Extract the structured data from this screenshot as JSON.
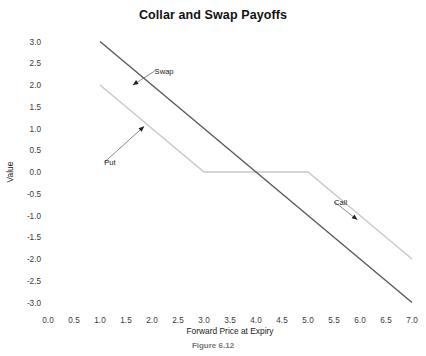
{
  "figure": {
    "title": "Collar and Swap Payoffs",
    "caption": "Figure 6.12"
  },
  "chart_data": {
    "type": "line",
    "title": "Collar and Swap Payoffs",
    "xlabel": "Forward Price at Expiry",
    "ylabel": "Value",
    "xlim": [
      0.0,
      7.0
    ],
    "ylim": [
      -3.0,
      3.0
    ],
    "xticks": [
      "0.0",
      "0.5",
      "1.0",
      "1.5",
      "2.0",
      "2.5",
      "3.0",
      "3.5",
      "4.0",
      "4.5",
      "5.0",
      "5.5",
      "6.0",
      "6.5",
      "7.0"
    ],
    "yticks": [
      "3.0",
      "2.5",
      "2.0",
      "1.5",
      "1.0",
      "0.5",
      "0.0",
      "-0.5",
      "-1.0",
      "-1.5",
      "-2.0",
      "-2.5",
      "-3.0"
    ],
    "grid": false,
    "legend": "annotations",
    "series": [
      {
        "name": "Collar",
        "color": "#c8c8c8",
        "points": [
          {
            "x": 1.0,
            "y": 2.0
          },
          {
            "x": 3.0,
            "y": 0.0
          },
          {
            "x": 5.0,
            "y": 0.0
          },
          {
            "x": 7.0,
            "y": -2.0
          }
        ]
      },
      {
        "name": "Swap",
        "color": "#5a5a5a",
        "points": [
          {
            "x": 1.0,
            "y": 3.0
          },
          {
            "x": 7.0,
            "y": -3.0
          }
        ]
      }
    ],
    "annotations": [
      {
        "label": "Swap",
        "text_x": 2.05,
        "text_y": 2.32,
        "point_x": 1.63,
        "point_y": 2.0
      },
      {
        "label": "Put",
        "text_x": 1.08,
        "text_y": 0.22,
        "point_x": 1.85,
        "point_y": 1.05
      },
      {
        "label": "Call",
        "text_x": 5.5,
        "text_y": -0.68,
        "point_x": 5.95,
        "point_y": -1.1
      }
    ]
  }
}
